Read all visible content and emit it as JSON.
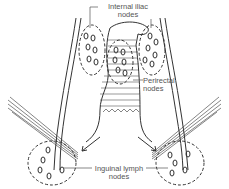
{
  "diagram": {
    "labels": {
      "internal_iliac": "Internal iliac nodes",
      "internal_iliac_line1": "Internal iliac",
      "internal_iliac_line2": "nodes",
      "perirectal_line1": "Perirectal",
      "perirectal_line2": "nodes",
      "inguinal_line1": "Inguinal lymph",
      "inguinal_line2": "nodes"
    },
    "node_groups": [
      {
        "name": "internal-iliac-left",
        "label": "Internal iliac nodes"
      },
      {
        "name": "internal-iliac-right",
        "label": "Internal iliac nodes"
      },
      {
        "name": "perirectal",
        "label": "Perirectal nodes"
      },
      {
        "name": "inguinal-left",
        "label": "Inguinal lymph nodes"
      },
      {
        "name": "inguinal-right",
        "label": "Inguinal lymph nodes"
      }
    ],
    "colors": {
      "line": "#333333",
      "label": "#555555",
      "background": "#ffffff"
    }
  }
}
